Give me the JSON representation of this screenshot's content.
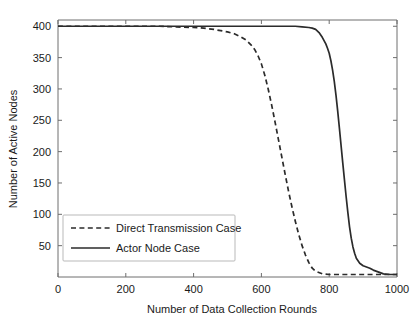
{
  "chart_data": {
    "type": "line",
    "title": "",
    "xlabel": "Number of Data Collection Rounds",
    "ylabel": "Number of Active Nodes",
    "xlim": [
      0,
      1000
    ],
    "ylim": [
      0,
      410
    ],
    "xticks": [
      0,
      200,
      400,
      600,
      800,
      1000
    ],
    "xtick_labels": [
      "0",
      "200",
      "400",
      "600",
      "800",
      "1000"
    ],
    "yticks": [
      50,
      100,
      150,
      200,
      250,
      300,
      350,
      400
    ],
    "ytick_labels": [
      "50",
      "100",
      "150",
      "200",
      "250",
      "300",
      "350",
      "400"
    ],
    "grid": false,
    "legend_position": "lower left",
    "series": [
      {
        "name": "Direct Transmission Case",
        "style": "dashed",
        "color": "#2b2b2b",
        "x": [
          0,
          50,
          100,
          150,
          200,
          250,
          300,
          350,
          400,
          430,
          460,
          480,
          500,
          520,
          540,
          555,
          570,
          580,
          590,
          600,
          610,
          620,
          630,
          640,
          650,
          660,
          670,
          680,
          690,
          700,
          710,
          720,
          730,
          740,
          750,
          760,
          780,
          800,
          850,
          900,
          950,
          1000
        ],
        "y": [
          400,
          400,
          400,
          400,
          400,
          400,
          400,
          399,
          398,
          397,
          395,
          393,
          391,
          388,
          383,
          378,
          370,
          363,
          353,
          340,
          322,
          300,
          275,
          248,
          220,
          192,
          164,
          137,
          112,
          89,
          68,
          50,
          35,
          23,
          14,
          9,
          5,
          4,
          4,
          4,
          4,
          4
        ]
      },
      {
        "name": "Actor Node Case",
        "style": "solid",
        "color": "#2b2b2b",
        "x": [
          0,
          100,
          200,
          300,
          400,
          500,
          600,
          650,
          700,
          720,
          740,
          750,
          760,
          770,
          780,
          790,
          795,
          800,
          805,
          810,
          815,
          820,
          825,
          830,
          835,
          840,
          845,
          850,
          855,
          860,
          865,
          870,
          875,
          880,
          890,
          900,
          910,
          920,
          930,
          940,
          950,
          960,
          980,
          1000
        ],
        "y": [
          400,
          400,
          400,
          400,
          400,
          400,
          400,
          400,
          400,
          399,
          398,
          397,
          395,
          390,
          382,
          372,
          365,
          357,
          345,
          330,
          312,
          290,
          265,
          238,
          210,
          182,
          155,
          128,
          103,
          80,
          62,
          48,
          38,
          30,
          22,
          18,
          16,
          14,
          11,
          9,
          7,
          5,
          4,
          4
        ]
      }
    ]
  },
  "legend": {
    "items": [
      {
        "label": "Direct Transmission Case"
      },
      {
        "label": "Actor Node Case"
      }
    ]
  }
}
